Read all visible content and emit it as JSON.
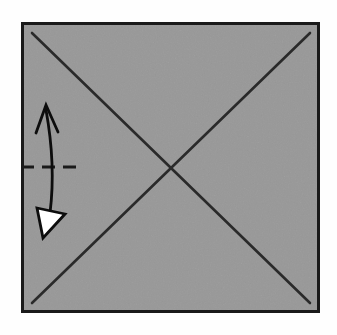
{
  "figure": {
    "kind": "origami-fold-diagram",
    "canvas": {
      "width": 337,
      "height": 335,
      "background_color": "#fefefe"
    }
  },
  "paper": {
    "name": "square-sheet",
    "shape": "square",
    "fill_color": "#989898",
    "stroke_color": "#1a1a1a",
    "stroke_width": 3,
    "x": 21,
    "y": 22,
    "width": 299,
    "height": 291
  },
  "creases": {
    "stroke_color": "#2a2a2a",
    "stroke_width": 2.6,
    "lines": [
      {
        "name": "diagonal-crease-top-left-to-bottom-right",
        "style": "solid",
        "x1": 32,
        "y1": 33,
        "x2": 310,
        "y2": 303
      },
      {
        "name": "diagonal-crease-top-right-to-bottom-left",
        "style": "solid",
        "x1": 310,
        "y1": 33,
        "x2": 32,
        "y2": 303
      }
    ],
    "intersection": {
      "x": 171,
      "y": 168,
      "label": "center"
    }
  },
  "fold_line": {
    "name": "valley-fold-dashed-line",
    "style": "dashed",
    "stroke_color": "#1a1a1a",
    "stroke_width": 2.8,
    "dash_pattern": "13 8",
    "x1": 21,
    "y1": 167,
    "x2": 78,
    "y2": 167
  },
  "fold_arrow": {
    "name": "fold-and-unfold-arrow",
    "stroke_color": "#0d0d0d",
    "stroke_width": 2.8,
    "shaft": {
      "description": "slightly curved vertical shaft",
      "start_x": 46,
      "start_y": 110,
      "control_x": 56,
      "control_y": 165,
      "end_x": 50,
      "end_y": 213
    },
    "head_up": {
      "name": "open-arrowhead-up",
      "type": "open-v",
      "tip_x": 46,
      "tip_y": 105,
      "left_x": 36,
      "left_y": 133,
      "right_x": 58,
      "right_y": 132,
      "fill": "none"
    },
    "head_down": {
      "name": "hollow-arrowhead-down",
      "type": "filled-triangle-hollow",
      "fill_color": "#ffffff",
      "stroke_color": "#0d0d0d",
      "points": "37,208 65,214 43,238"
    }
  },
  "legend": {
    "dashed_line_meaning": "valley fold line",
    "solid_line_meaning": "existing crease",
    "hollow_arrow_meaning": "fold then unfold"
  }
}
